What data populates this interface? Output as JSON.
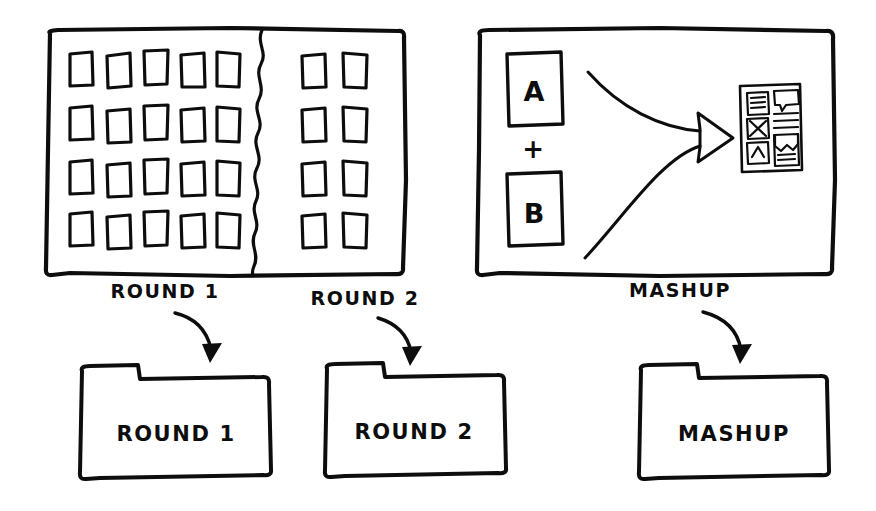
{
  "canvas": {
    "width": 876,
    "height": 511,
    "background_color": "#ffffff",
    "ink_color": "#0d0d0d",
    "style": "hand-drawn sketch / whiteboard marker"
  },
  "panels": [
    {
      "id": "rounds-panel",
      "name": "sketch-grid-panel",
      "description": "Large framed rectangle divided by a vertical wavy tear line",
      "left_section": {
        "name": "round-1-grid",
        "columns": 5,
        "rows": 4,
        "cell_count": 20
      },
      "right_section": {
        "name": "round-2-grid",
        "columns": 2,
        "rows": 4,
        "cell_count": 8
      },
      "divider": "wavy-vertical-line"
    },
    {
      "id": "mashup-panel",
      "name": "mashup-panel",
      "description": "Framed rectangle showing card A plus card B combining into a wireframe mockup",
      "inputs": [
        {
          "label": "A",
          "name": "card-a"
        },
        {
          "label": "B",
          "name": "card-b"
        }
      ],
      "operator": "+",
      "arrow": "two-curved-arrows-merging-right",
      "output": {
        "name": "wireframe-mockup",
        "left_column_icons": [
          "list-lines-icon",
          "x-close-icon",
          "chevron-up-icon"
        ],
        "right_column_blocks": [
          "speech-bubble-block",
          "text-lines-block",
          "content-card-block"
        ]
      }
    }
  ],
  "flow_labels": [
    {
      "text": "ROUND 1",
      "name": "label-round-1"
    },
    {
      "text": "ROUND 2",
      "name": "label-round-2"
    },
    {
      "text": "MASHUP",
      "name": "label-mashup"
    }
  ],
  "folders": [
    {
      "text": "ROUND 1",
      "name": "folder-round-1"
    },
    {
      "text": "ROUND 2",
      "name": "folder-round-2"
    },
    {
      "text": "MASHUP",
      "name": "folder-mashup"
    }
  ],
  "card_letters": {
    "a": "A",
    "b": "B",
    "plus": "+"
  }
}
